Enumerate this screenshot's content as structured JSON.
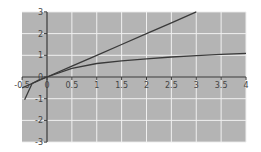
{
  "chart_data": {
    "type": "line",
    "title": "",
    "xlabel": "",
    "ylabel": "",
    "xlim": [
      -0.5,
      4
    ],
    "ylim": [
      -3,
      3
    ],
    "grid": true,
    "legend": null,
    "x_ticks": [
      -0.5,
      0,
      0.5,
      1,
      1.5,
      2,
      2.5,
      3,
      3.5,
      4
    ],
    "x_tick_labels": [
      "-0.5",
      "0",
      "0.5",
      "1",
      "1.5",
      "2",
      "2.5",
      "3",
      "3.5",
      "4"
    ],
    "y_ticks": [
      -3,
      -2,
      -1,
      0,
      1,
      2,
      3
    ],
    "y_tick_labels": [
      "-3",
      "-2",
      "-1",
      "0",
      "1",
      "2",
      "3"
    ],
    "series": [
      {
        "name": "line",
        "x": [
          -0.5,
          0,
          0.5,
          1,
          1.5,
          2,
          2.5,
          3
        ],
        "y": [
          -0.5,
          0,
          0.5,
          1,
          1.5,
          2,
          2.5,
          3
        ]
      },
      {
        "name": "curve",
        "x": [
          -0.45,
          -0.3,
          -0.15,
          0,
          0.5,
          1,
          1.5,
          2,
          2.5,
          3,
          3.5,
          4
        ],
        "y": [
          -1.05,
          -0.3,
          -0.12,
          0,
          0.4,
          0.62,
          0.74,
          0.84,
          0.92,
          0.98,
          1.04,
          1.09
        ]
      }
    ],
    "colors": {
      "plot_background": "#b4b4b4",
      "grid": "#f0f0f0",
      "axis": "#3a3a3a",
      "line": "#3a3a3a"
    }
  }
}
